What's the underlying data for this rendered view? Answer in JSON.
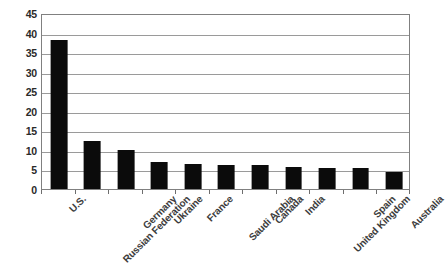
{
  "chart_data": {
    "type": "bar",
    "title": "",
    "subtitle": "",
    "xlabel": "",
    "ylabel": "",
    "ylim": [
      0,
      45
    ],
    "ytick_step": 5,
    "yticks": [
      45,
      40,
      35,
      30,
      25,
      20,
      15,
      10,
      5,
      0
    ],
    "grid": true,
    "legend": false,
    "legend_position": "none",
    "bar_color": "#0b0b0b",
    "grid_color": "#9a9a9a",
    "frame_color": "#808080",
    "categories": [
      "U.S.",
      "Russian Federation",
      "Germany",
      "Ukraine",
      "France",
      "Saudi Arabia",
      "Canada",
      "India",
      "United Kingdom",
      "Spain",
      "Australia"
    ],
    "values": [
      38,
      12.3,
      10,
      6.8,
      6.3,
      6.2,
      6.1,
      5.6,
      5.5,
      5.4,
      4.3
    ]
  }
}
